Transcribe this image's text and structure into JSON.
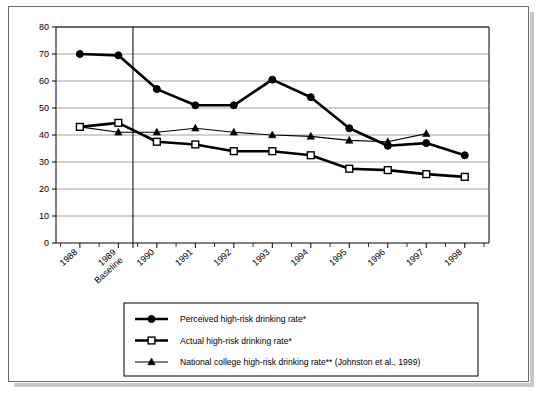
{
  "chart_data": {
    "type": "line",
    "title": "",
    "xlabel": "",
    "ylabel": "",
    "ylim": [
      0,
      80
    ],
    "ytick_step": 10,
    "yticks": [
      "0",
      "10",
      "20",
      "30",
      "40",
      "50",
      "60",
      "70",
      "80"
    ],
    "grid": true,
    "legend_position": "bottom",
    "categories": [
      "1988",
      "1989 Baseline",
      "1990",
      "1991",
      "1992",
      "1993",
      "1994",
      "1995",
      "1996",
      "1997",
      "1998"
    ],
    "category_lines": [
      [
        "1988"
      ],
      [
        "1989",
        "Baseline"
      ],
      [
        "1990"
      ],
      [
        "1991"
      ],
      [
        "1992"
      ],
      [
        "1993"
      ],
      [
        "1994"
      ],
      [
        "1995"
      ],
      [
        "1996"
      ],
      [
        "1997"
      ],
      [
        "1998"
      ]
    ],
    "baseline_marker_index": 1,
    "series": [
      {
        "name": "Perceived high-risk drinking rate*",
        "marker": "filled-circle",
        "line_weight": "thick",
        "color": "#000000",
        "values": [
          70,
          69.5,
          57,
          51,
          51,
          60.5,
          54,
          42.5,
          36,
          37,
          32.5
        ]
      },
      {
        "name": "Actual high-risk drinking rate*",
        "marker": "open-square",
        "line_weight": "thick",
        "color": "#000000",
        "values": [
          43,
          44.5,
          37.5,
          36.5,
          34,
          34,
          32.5,
          27.5,
          27,
          25.5,
          24.5
        ]
      },
      {
        "name": "National college high-risk drinking rate** (Johnston et al., 1999)",
        "marker": "filled-triangle",
        "line_weight": "thin",
        "color": "#000000",
        "values": [
          43,
          41,
          41,
          42.5,
          41,
          40,
          39.5,
          38,
          37.5,
          40.5,
          null
        ]
      }
    ]
  },
  "legend": {
    "entries": [
      "Perceived high-risk drinking rate*",
      "Actual high-risk drinking rate*",
      "National college high-risk drinking rate** (Johnston et al., 1999)"
    ]
  }
}
